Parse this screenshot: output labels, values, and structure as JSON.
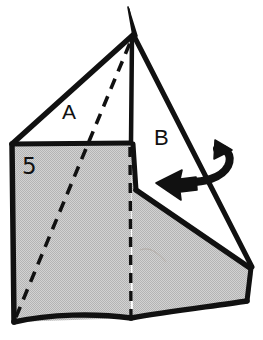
{
  "figure": {
    "kind": "origami-fold-diagram",
    "step_number": "5",
    "background_color": "#ffffff",
    "ink_color": "#111111",
    "paper_shaded_color": "#c9c9c9",
    "paper_white_color": "#ffffff",
    "labels": {
      "flap_a": "A",
      "flap_b": "B",
      "step": "5"
    },
    "annotations": {
      "fold_arrow": {
        "name": "fold-over-arrow",
        "direction": "right-to-left",
        "style": "curved valley-fold arrow with hook tail",
        "color": "#111111"
      },
      "dashed_lines": [
        {
          "name": "diagonal-crease",
          "style": "dashed",
          "from": "bottom-left-corner",
          "to": "top-apex"
        },
        {
          "name": "vertical-crease",
          "style": "dashed",
          "from": "horizontal-fold-edge",
          "to": "bottom-edge"
        }
      ]
    },
    "regions": [
      {
        "name": "front-shaded-panel",
        "fill": "shaded"
      },
      {
        "name": "flap-a-white-triangle",
        "fill": "white"
      },
      {
        "name": "flap-b-white-triangle",
        "fill": "white"
      },
      {
        "name": "lower-right-shaded-wing",
        "fill": "shaded"
      }
    ]
  }
}
